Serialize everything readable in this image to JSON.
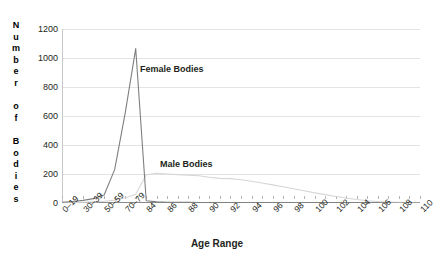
{
  "chart_data": {
    "type": "line",
    "title": "",
    "xlabel": "Age Range",
    "ylabel": "Number of Bodies",
    "ylabel_letters": [
      "N",
      "u",
      "m",
      "b",
      "e",
      "r",
      "",
      "o",
      "f",
      "",
      "B",
      "o",
      "d",
      "i",
      "e",
      "s"
    ],
    "ylim": [
      0,
      1200
    ],
    "yticks": [
      0,
      200,
      400,
      600,
      800,
      1000,
      1200
    ],
    "ytick_labels": [
      "0",
      "200",
      "400",
      "600",
      "800",
      "1000",
      "1200"
    ],
    "grid": true,
    "legend_position": "inline-annotations",
    "categories": [
      "0-19",
      "20-29",
      "30-39",
      "40-49",
      "50-59",
      "60-69",
      "70-79",
      "80-83",
      "84",
      "85",
      "86",
      "87",
      "88",
      "89",
      "90",
      "91",
      "92",
      "93",
      "94",
      "95",
      "96",
      "97",
      "98",
      "99",
      "100",
      "101",
      "102",
      "103",
      "104",
      "105",
      "106",
      "107",
      "108",
      "109",
      "110"
    ],
    "tick_labels_shown": [
      "0-19",
      "30-39",
      "50-59",
      "70-79",
      "84",
      "86",
      "88",
      "90",
      "92",
      "94",
      "96",
      "98",
      "100",
      "102",
      "104",
      "106",
      "108",
      "110"
    ],
    "series": [
      {
        "name": "Female Bodies",
        "color": "#7f7f7f",
        "values": [
          5,
          10,
          18,
          30,
          55,
          230,
          620,
          1065,
          15,
          8,
          5,
          4,
          4,
          3,
          3,
          3,
          2,
          2,
          2,
          2,
          2,
          1,
          1,
          1,
          1,
          1,
          1,
          0,
          0,
          0,
          0,
          0,
          0,
          0,
          0
        ]
      },
      {
        "name": "Male Bodies",
        "color": "#d6d6d6",
        "values": [
          2,
          3,
          5,
          8,
          12,
          20,
          35,
          60,
          195,
          205,
          200,
          196,
          192,
          188,
          178,
          170,
          168,
          160,
          150,
          138,
          125,
          112,
          98,
          85,
          70,
          58,
          45,
          34,
          24,
          16,
          10,
          6,
          4,
          2,
          1
        ]
      }
    ],
    "annotations": [
      {
        "text": "Female Bodies",
        "target_series": "Female Bodies"
      },
      {
        "text": "Male Bodies",
        "target_series": "Male Bodies"
      }
    ]
  }
}
